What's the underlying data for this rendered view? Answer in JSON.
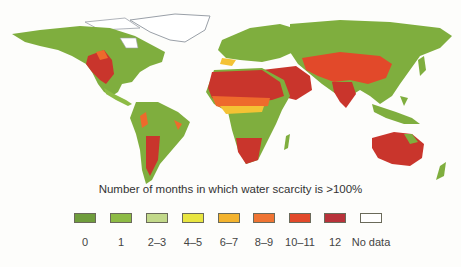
{
  "caption": "Number of months in which water scarcity is >100%",
  "legend": {
    "items": [
      {
        "label": "0",
        "color": "#6f9d3c"
      },
      {
        "label": "1",
        "color": "#8dbb45"
      },
      {
        "label": "2–3",
        "color": "#c2d98a"
      },
      {
        "label": "4–5",
        "color": "#e8e540"
      },
      {
        "label": "6–7",
        "color": "#f3b32e"
      },
      {
        "label": "8–9",
        "color": "#ef7433"
      },
      {
        "label": "10–11",
        "color": "#e2492a"
      },
      {
        "label": "12",
        "color": "#b8323a"
      },
      {
        "label": "No data",
        "color": "#ffffff"
      }
    ]
  },
  "map": {
    "subject": "World map of water scarcity duration",
    "colors": {
      "land_default": "#7fae3e",
      "high": "#c9352c",
      "mid": "#ee6a2c",
      "low": "#f4c234",
      "nodata": "#ffffff",
      "outline": "#9aa0a8"
    }
  }
}
